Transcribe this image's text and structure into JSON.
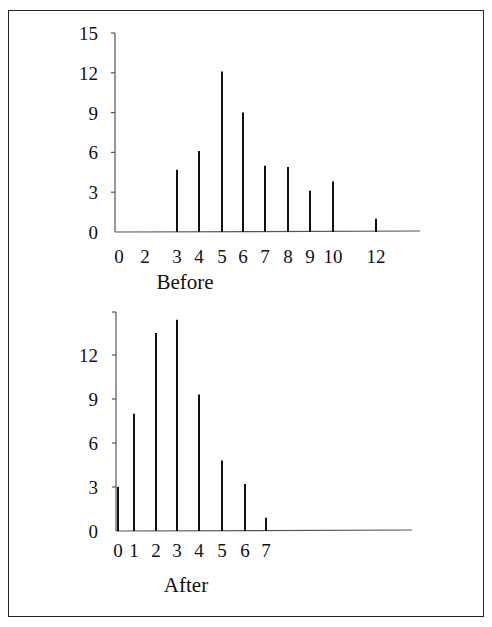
{
  "chart_data": [
    {
      "type": "bar",
      "title": "Before",
      "xlabel": "Before",
      "ylabel": "",
      "categories": [
        "0",
        "2",
        "3",
        "4",
        "5",
        "6",
        "7",
        "8",
        "9",
        "10",
        "12"
      ],
      "x": [
        3,
        4,
        5,
        6,
        7,
        8,
        9,
        10,
        12
      ],
      "values": [
        4.7,
        6.1,
        12.1,
        9.0,
        5.0,
        4.9,
        3.1,
        3.8,
        1.0
      ],
      "x_tick_labels": [
        "0",
        "2",
        "3",
        "4",
        "5",
        "6",
        "7",
        "8",
        "9",
        "10",
        "12"
      ],
      "y_tick_labels": [
        "0",
        "3",
        "6",
        "9",
        "12",
        "15"
      ],
      "ylim": [
        0,
        15
      ],
      "grid": false,
      "style": "spike/stem lines"
    },
    {
      "type": "bar",
      "title": "After",
      "xlabel": "After",
      "ylabel": "",
      "categories": [
        "0",
        "1",
        "2",
        "3",
        "4",
        "5",
        "6",
        "7"
      ],
      "x": [
        0,
        1,
        2,
        3,
        4,
        5,
        6,
        7
      ],
      "values": [
        3.0,
        8.0,
        13.5,
        14.4,
        9.3,
        4.8,
        3.2,
        0.9
      ],
      "x_tick_labels": [
        "0",
        "1",
        "2",
        "3",
        "4",
        "5",
        "6",
        "7"
      ],
      "y_tick_labels": [
        "0",
        "3",
        "6",
        "9",
        "12"
      ],
      "ylim": [
        0,
        15
      ],
      "grid": false,
      "style": "spike/stem lines"
    }
  ],
  "colors": {
    "line": "#111111",
    "axis": "#555555",
    "background": "#ffffff",
    "frame": "#222222"
  }
}
